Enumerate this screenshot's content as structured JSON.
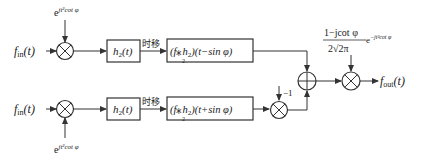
{
  "diagram": {
    "title": "",
    "input_label": "f_in(t)",
    "input_main": "f",
    "input_sub": "in",
    "input_arg": "(t)",
    "output_main": "f",
    "output_sub": "out",
    "output_arg": "(t)",
    "upper": {
      "chirp_base": "e",
      "chirp_exp": "jt²cot φ",
      "filter_main": "h",
      "filter_sub": "2",
      "filter_arg": "(t)",
      "shift_label": "时移",
      "shifted_label": "(f⁎h₂)(t−sin φ)",
      "shifted_conv": "(f",
      "shifted_star_sub": "2",
      "shifted_h": "h",
      "shifted_h_sub": "2",
      "shifted_arg": ")(t−sin φ)"
    },
    "lower": {
      "chirp_base": "e",
      "chirp_exp": "jt²cot φ",
      "filter_main": "h",
      "filter_sub": "2",
      "filter_arg": "(t)",
      "shift_label": "时移",
      "shifted_label": "(f⁎h₂)(t+sin φ)",
      "shifted_conv": "(f",
      "shifted_star_sub": "2",
      "shifted_h": "h",
      "shifted_h_sub": "2",
      "shifted_arg": ")(t+sin φ)",
      "gain_label": "−1"
    },
    "output_gain": {
      "numerator": "1−jcot φ",
      "denominator": "2√2π",
      "exp_base": "e",
      "exp_power": "−jt²cot φ"
    },
    "icons": {
      "multiplier": "⊗",
      "adder": "⊕"
    }
  }
}
